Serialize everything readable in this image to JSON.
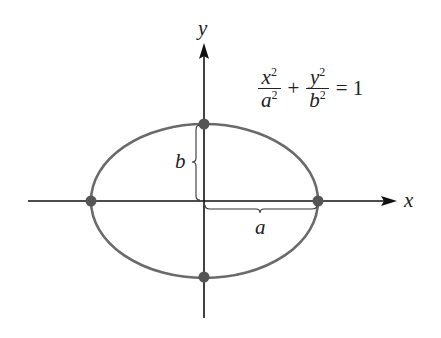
{
  "figure": {
    "equation": {
      "term1": {
        "numerator": "x",
        "numerator_exp": "2",
        "denominator": "a",
        "denominator_exp": "2"
      },
      "operator": "+",
      "term2": {
        "numerator": "y",
        "numerator_exp": "2",
        "denominator": "b",
        "denominator_exp": "2"
      },
      "equals": "=",
      "rhs": "1"
    },
    "axes": {
      "x_label": "x",
      "y_label": "y"
    },
    "semi_axis_labels": {
      "horizontal": "a",
      "vertical": "b"
    },
    "vertices": [
      {
        "name": "right",
        "coords": "(a, 0)"
      },
      {
        "name": "left",
        "coords": "(-a, 0)"
      },
      {
        "name": "top",
        "coords": "(0, b)"
      },
      {
        "name": "bottom",
        "coords": "(0, -b)"
      }
    ],
    "colors": {
      "axis": "#111111",
      "ellipse": "#6a6a6a",
      "vertex": "#555555",
      "brace": "#333333"
    }
  }
}
